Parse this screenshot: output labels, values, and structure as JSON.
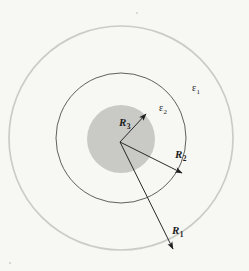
{
  "figure": {
    "background_color": "#f7f7f4",
    "center": {
      "x": 121,
      "y": 138
    },
    "arrow_origin": {
      "x": 120,
      "y": 142
    },
    "regions": [
      {
        "name": "outer-boundary",
        "label": "R1",
        "radius": 112,
        "stroke_color": "#cbcbc7",
        "stroke_width": 1.6,
        "fill": "none"
      },
      {
        "name": "middle-boundary",
        "label": "R2",
        "radius": 65,
        "stroke_color": "#4a4a4a",
        "stroke_width": 0.9,
        "fill": "none"
      },
      {
        "name": "inner-disk",
        "label": "R3",
        "radius": 34,
        "stroke_color": "none",
        "stroke_width": 0,
        "fill": "#c9c9c6"
      }
    ],
    "arrows": [
      {
        "name": "arrow-r3",
        "label": "R3",
        "angle_deg": 47,
        "length": 38,
        "tip": {
          "x": 146,
          "y": 114
        }
      },
      {
        "name": "arrow-r2",
        "label": "R2",
        "angle_deg": -27,
        "length": 69,
        "tip": {
          "x": 181,
          "y": 173
        }
      },
      {
        "name": "arrow-r1",
        "label": "R1",
        "angle_deg": -56,
        "length": 117,
        "tip": {
          "x": 172,
          "y": 249
        }
      }
    ],
    "labels": {
      "epsilon_1": {
        "symbol": "ε",
        "subscript": "1",
        "x": 192,
        "y": 83
      },
      "epsilon_2": {
        "symbol": "ε",
        "subscript": "2",
        "x": 159,
        "y": 103
      },
      "radius_3": {
        "symbol": "R",
        "subscript": "3",
        "x": 119,
        "y": 117
      },
      "radius_2": {
        "symbol": "R",
        "subscript": "2",
        "x": 175,
        "y": 149
      },
      "radius_1": {
        "symbol": "R",
        "subscript": "1",
        "x": 172,
        "y": 225
      }
    }
  }
}
